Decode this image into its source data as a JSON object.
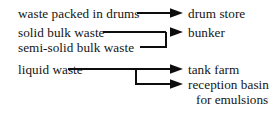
{
  "diagram": {
    "background_color": "#ffffff",
    "line_color": "#0d0d0d",
    "text_color": "#141414",
    "sources": [
      {
        "id": "waste-packed-in-drums",
        "label": "waste packed in drums",
        "x": 18,
        "y": 6
      },
      {
        "id": "solid-bulk-waste",
        "label": "solid bulk waste",
        "x": 18,
        "y": 25
      },
      {
        "id": "semi-solid-bulk-waste",
        "label": "semi-solid bulk waste",
        "x": 18,
        "y": 40
      },
      {
        "id": "liquid-waste",
        "label": "liquid waste",
        "x": 18,
        "y": 62
      }
    ],
    "targets": [
      {
        "id": "drum-store",
        "label": "drum store",
        "x": 188,
        "y": 6
      },
      {
        "id": "bunker",
        "label": "bunker",
        "x": 188,
        "y": 25
      },
      {
        "id": "tank-farm",
        "label": "tank farm",
        "x": 188,
        "y": 62
      },
      {
        "id": "reception-basin",
        "label": "reception basin",
        "x": 188,
        "y": 77
      },
      {
        "id": "reception-basin-line2",
        "label": "for emulsions",
        "x": 196,
        "y": 92
      }
    ],
    "edges": [
      {
        "id": "edge-drums-to-drum-store",
        "from": "waste packed in drums",
        "to": "drum store",
        "kind": "straight"
      },
      {
        "id": "edge-solid-to-bunker",
        "from": "solid bulk waste",
        "to": "bunker",
        "kind": "merge"
      },
      {
        "id": "edge-semisolid-to-bunker",
        "from": "semi-solid bulk waste",
        "to": "bunker",
        "kind": "merge"
      },
      {
        "id": "edge-liquid-to-tank-farm",
        "from": "liquid waste",
        "to": "tank farm",
        "kind": "split"
      },
      {
        "id": "edge-liquid-to-reception-basin",
        "from": "liquid waste",
        "to": "reception basin for emulsions",
        "kind": "split"
      }
    ],
    "geometry": {
      "row1_y": 13,
      "row2_y": 32,
      "row3_y": 47,
      "row4_y": 69,
      "row5_y": 84,
      "merge_junction_x": 166,
      "split_junction_x": 136,
      "arrow_tip_x": 183
    }
  }
}
